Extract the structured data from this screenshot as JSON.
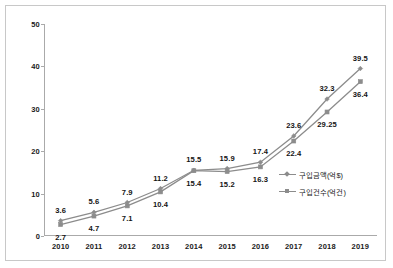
{
  "chart_data": {
    "type": "line",
    "title": "",
    "xlabel": "",
    "ylabel": "",
    "categories": [
      "2010",
      "2011",
      "2012",
      "2013",
      "2014",
      "2015",
      "2016",
      "2017",
      "2018",
      "2019"
    ],
    "ylim": [
      0,
      50
    ],
    "yticks": [
      "0",
      "10",
      "20",
      "30",
      "40",
      "50"
    ],
    "grid": false,
    "legend_position": "right-inside",
    "series": [
      {
        "name": "구입금액(억$)",
        "marker": "diamond",
        "color": "#8c8c8c",
        "values": [
          3.6,
          5.6,
          7.9,
          11.2,
          15.5,
          15.9,
          17.4,
          23.6,
          32.3,
          39.5
        ],
        "labels": [
          "3.6",
          "5.6",
          "7.9",
          "11.2",
          "15.5",
          "15.9",
          "17.4",
          "23.6",
          "32.3",
          "39.5"
        ]
      },
      {
        "name": "구입건수(억건)",
        "marker": "square",
        "color": "#8c8c8c",
        "values": [
          2.7,
          4.7,
          7.1,
          10.4,
          15.4,
          15.2,
          16.3,
          22.4,
          29.25,
          36.4
        ],
        "labels": [
          "2.7",
          "4.7",
          "7.1",
          "10.4",
          "15.4",
          "15.2",
          "16.3",
          "22.4",
          "29.25",
          "36.4"
        ]
      }
    ]
  },
  "legend": {
    "items": [
      {
        "label": "구입금액(억$)"
      },
      {
        "label": "구입건수(억건)"
      }
    ]
  }
}
